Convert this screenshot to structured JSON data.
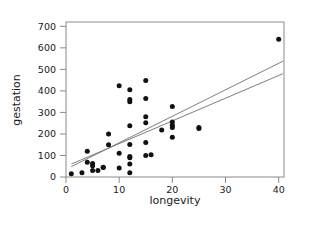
{
  "chart_data": {
    "type": "scatter",
    "title": "",
    "xlabel": "longevity",
    "ylabel": "gestation",
    "xlim": [
      0,
      41
    ],
    "ylim": [
      0,
      720
    ],
    "xticks": [
      0,
      10,
      20,
      30,
      40
    ],
    "yticks": [
      0,
      100,
      200,
      300,
      400,
      500,
      600,
      700
    ],
    "xtick_labels": [
      "0",
      "10",
      "20",
      "30",
      "40"
    ],
    "ytick_labels": [
      "0",
      "100",
      "200",
      "300",
      "400",
      "500",
      "600",
      "700"
    ],
    "grid": false,
    "legend": null,
    "points": [
      [
        1,
        15
      ],
      [
        3,
        20
      ],
      [
        4,
        120
      ],
      [
        4,
        68
      ],
      [
        5,
        63
      ],
      [
        5,
        30
      ],
      [
        5,
        52
      ],
      [
        6,
        30
      ],
      [
        7,
        45
      ],
      [
        7,
        44
      ],
      [
        8,
        200
      ],
      [
        8,
        150
      ],
      [
        10,
        424
      ],
      [
        10,
        110
      ],
      [
        10,
        42
      ],
      [
        12,
        405
      ],
      [
        12,
        360
      ],
      [
        12,
        350
      ],
      [
        12,
        238
      ],
      [
        12,
        151
      ],
      [
        12,
        95
      ],
      [
        12,
        90
      ],
      [
        12,
        60
      ],
      [
        12,
        20
      ],
      [
        15,
        448
      ],
      [
        15,
        365
      ],
      [
        15,
        280
      ],
      [
        15,
        252
      ],
      [
        15,
        160
      ],
      [
        15,
        100
      ],
      [
        16,
        103
      ],
      [
        18,
        218
      ],
      [
        20,
        328
      ],
      [
        20,
        255
      ],
      [
        20,
        240
      ],
      [
        20,
        230
      ],
      [
        20,
        185
      ],
      [
        25,
        230
      ],
      [
        25,
        225
      ],
      [
        40,
        640
      ]
    ],
    "regression_lines": [
      {
        "name": "line-upper",
        "x0": 1.0,
        "y0": 48,
        "x1": 40.8,
        "y1": 538
      },
      {
        "name": "line-lower",
        "x0": 1.0,
        "y0": 60,
        "x1": 40.8,
        "y1": 480
      }
    ]
  },
  "axes": {
    "xlabel_name": "longevity",
    "ylabel_name": "gestation"
  }
}
